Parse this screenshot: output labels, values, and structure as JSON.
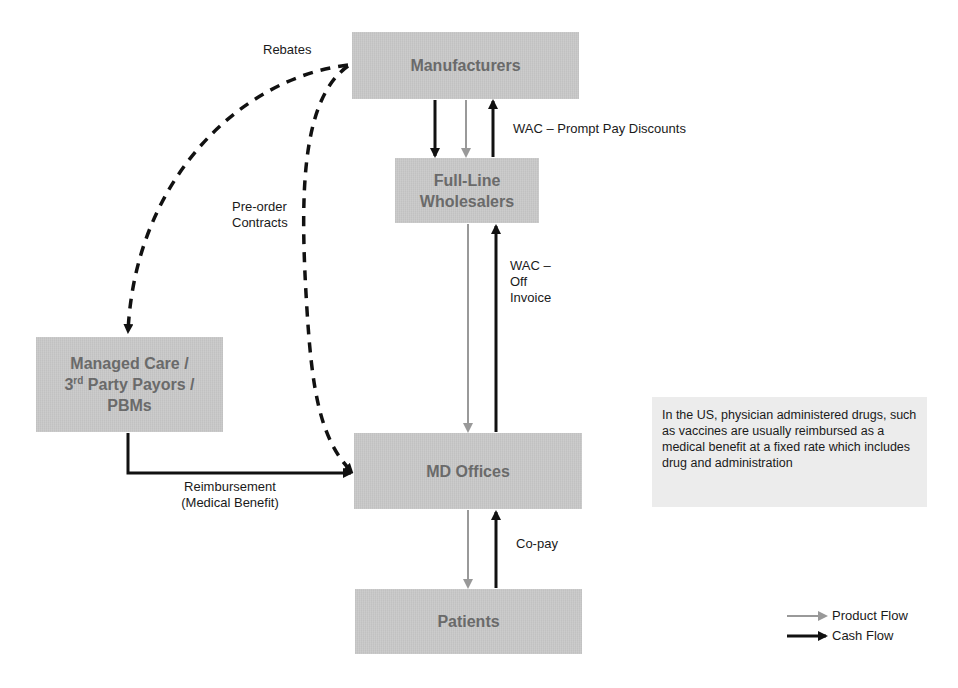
{
  "nodes": {
    "manufacturers": "Manufacturers",
    "wholesalers_line1": "Full-Line",
    "wholesalers_line2": "Wholesalers",
    "managed_care_line1": "Managed Care /",
    "managed_care_line2_prefix": "3",
    "managed_care_line2_sup": "rd",
    "managed_care_line2_suffix": " Party Payors /",
    "managed_care_line3": "PBMs",
    "md_offices": "MD Offices",
    "patients": "Patients"
  },
  "edge_labels": {
    "rebates": "Rebates",
    "preorder_line1": "Pre-order",
    "preorder_line2": "Contracts",
    "wac_prompt": "WAC – Prompt Pay Discounts",
    "wac_off_line1": "WAC –",
    "wac_off_line2": "Off",
    "wac_off_line3": "Invoice",
    "reimbursement_line1": "Reimbursement",
    "reimbursement_line2": "(Medical Benefit)",
    "copay": "Co-pay"
  },
  "note": "In the US, physician administered drugs, such as vaccines are usually reimbursed as a medical benefit at a fixed rate which includes drug and administration",
  "legend": {
    "product_flow": "Product Flow",
    "cash_flow": "Cash Flow"
  },
  "colors": {
    "box_fill": "#c9c9c9",
    "box_text": "#6a6a6a",
    "product_flow": "#999999",
    "cash_flow": "#111111",
    "note_fill": "#ececec"
  }
}
